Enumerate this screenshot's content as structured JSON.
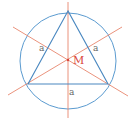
{
  "diagram": {
    "colors": {
      "circle": "#5b9bd0",
      "triangle": "#4a88c0",
      "lines": "#e8876e",
      "center_label": "#d9433a",
      "side_label": "#666666",
      "background": "#ffffff"
    },
    "circle": {
      "cx": 68,
      "cy": 61,
      "r": 48
    },
    "triangle": {
      "vertices": [
        [
          68,
          11
        ],
        [
          28,
          84
        ],
        [
          108,
          84
        ]
      ]
    },
    "lines": [
      {
        "x1": 68,
        "y1": 2,
        "x2": 68,
        "y2": 118
      },
      {
        "x1": 8,
        "y1": 95,
        "x2": 122,
        "y2": 27
      },
      {
        "x1": 13,
        "y1": 27,
        "x2": 128,
        "y2": 96
      }
    ],
    "center": {
      "x": 68,
      "y": 60,
      "label": "M"
    },
    "side_labels": [
      {
        "text": "a",
        "x": 39,
        "y": 51
      },
      {
        "text": "a",
        "x": 93,
        "y": 51
      },
      {
        "text": "a",
        "x": 69,
        "y": 95
      }
    ]
  }
}
